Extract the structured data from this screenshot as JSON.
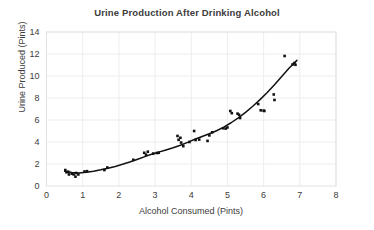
{
  "chart_data": {
    "type": "scatter",
    "title": "Urine Production After Drinking Alcohol",
    "xlabel": "Alcohol Consumed (Pints)",
    "ylabel": "Urine Produced (Pints)",
    "xlim": [
      0,
      8
    ],
    "ylim": [
      0,
      14
    ],
    "xticks": [
      0,
      1,
      2,
      3,
      4,
      5,
      6,
      7,
      8
    ],
    "yticks": [
      0,
      2,
      4,
      6,
      8,
      10,
      12,
      14
    ],
    "xtick_labels": [
      "0",
      "1",
      "2",
      "3",
      "4",
      "5",
      "6",
      "7",
      "8"
    ],
    "ytick_labels": [
      "0",
      "2",
      "4",
      "6",
      "8",
      "10",
      "12",
      "14"
    ],
    "grid": true,
    "legend": null,
    "marker_color": "#111111",
    "marker_shape": "square",
    "trend_line": {
      "type": "smooth-fit",
      "color": "#111111",
      "x_start": 0.5,
      "x_end": 6.92,
      "points": [
        [
          0.5,
          1.35
        ],
        [
          0.7,
          1.22
        ],
        [
          0.9,
          1.18
        ],
        [
          1.1,
          1.25
        ],
        [
          1.3,
          1.35
        ],
        [
          1.5,
          1.47
        ],
        [
          1.7,
          1.62
        ],
        [
          1.9,
          1.78
        ],
        [
          2.1,
          1.97
        ],
        [
          2.3,
          2.18
        ],
        [
          2.5,
          2.41
        ],
        [
          2.7,
          2.65
        ],
        [
          2.9,
          2.88
        ],
        [
          3.1,
          3.08
        ],
        [
          3.3,
          3.28
        ],
        [
          3.5,
          3.48
        ],
        [
          3.7,
          3.7
        ],
        [
          3.9,
          3.97
        ],
        [
          4.1,
          4.25
        ],
        [
          4.3,
          4.5
        ],
        [
          4.5,
          4.75
        ],
        [
          4.7,
          5.02
        ],
        [
          4.9,
          5.35
        ],
        [
          5.1,
          5.75
        ],
        [
          5.3,
          6.2
        ],
        [
          5.5,
          6.7
        ],
        [
          5.7,
          7.25
        ],
        [
          5.9,
          7.85
        ],
        [
          6.1,
          8.5
        ],
        [
          6.3,
          9.2
        ],
        [
          6.5,
          9.95
        ],
        [
          6.7,
          10.7
        ],
        [
          6.92,
          11.42
        ]
      ]
    },
    "points": [
      [
        0.52,
        1.45
      ],
      [
        0.55,
        1.25
      ],
      [
        0.6,
        1.3
      ],
      [
        0.62,
        1.05
      ],
      [
        0.7,
        1.12
      ],
      [
        0.75,
        1.05
      ],
      [
        0.8,
        0.85
      ],
      [
        0.82,
        1.18
      ],
      [
        0.88,
        1.05
      ],
      [
        1.05,
        1.32
      ],
      [
        1.12,
        1.35
      ],
      [
        1.6,
        1.45
      ],
      [
        1.68,
        1.68
      ],
      [
        2.4,
        2.38
      ],
      [
        2.7,
        3.02
      ],
      [
        2.75,
        2.85
      ],
      [
        2.8,
        3.12
      ],
      [
        2.95,
        2.95
      ],
      [
        3.05,
        3.0
      ],
      [
        3.1,
        3.02
      ],
      [
        3.62,
        4.55
      ],
      [
        3.65,
        4.2
      ],
      [
        3.7,
        4.38
      ],
      [
        3.72,
        3.95
      ],
      [
        3.78,
        3.62
      ],
      [
        3.95,
        4.0
      ],
      [
        4.08,
        5.0
      ],
      [
        4.12,
        4.18
      ],
      [
        4.22,
        4.22
      ],
      [
        4.45,
        4.1
      ],
      [
        4.5,
        4.6
      ],
      [
        4.58,
        4.88
      ],
      [
        4.88,
        5.25
      ],
      [
        4.95,
        5.22
      ],
      [
        5.0,
        5.32
      ],
      [
        5.08,
        6.82
      ],
      [
        5.12,
        6.62
      ],
      [
        5.28,
        6.58
      ],
      [
        5.32,
        6.48
      ],
      [
        5.35,
        6.18
      ],
      [
        5.85,
        7.45
      ],
      [
        5.92,
        6.88
      ],
      [
        6.0,
        6.85
      ],
      [
        6.02,
        6.82
      ],
      [
        6.28,
        8.32
      ],
      [
        6.3,
        7.82
      ],
      [
        6.58,
        11.82
      ],
      [
        6.8,
        11.05
      ],
      [
        6.85,
        11.18
      ],
      [
        6.88,
        11.02
      ]
    ]
  },
  "axes": {
    "title": "Urine Production After Drinking Alcohol",
    "x_label": "Alcohol Consumed (Pints)",
    "y_label": "Urine Produced (Pints)"
  }
}
